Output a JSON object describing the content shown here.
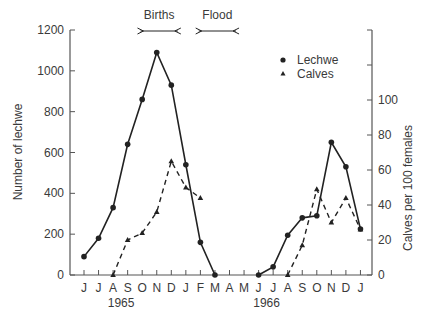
{
  "chart_data": {
    "type": "line",
    "title": "",
    "categories": [
      "J",
      "J",
      "A",
      "S",
      "O",
      "N",
      "D",
      "J",
      "F",
      "M",
      "A",
      "M",
      "J",
      "J",
      "A",
      "S",
      "O",
      "N",
      "D",
      "J"
    ],
    "year_labels": [
      {
        "label": "1965",
        "month_index": 2
      },
      {
        "label": "1966",
        "month_index": 12
      }
    ],
    "xlabel": "",
    "ylabel": "Number of lechwe",
    "ylabel_right": "Calves per 100 females",
    "ylim": [
      0,
      1200
    ],
    "ylim_right": [
      0,
      140
    ],
    "yticks": [
      0,
      200,
      400,
      600,
      800,
      1000,
      1200
    ],
    "yticks_right": [
      0,
      20,
      40,
      60,
      80,
      100
    ],
    "grid": false,
    "legend": {
      "position": "upper-right",
      "entries": [
        {
          "label": "Lechwe",
          "marker": "circle"
        },
        {
          "label": "Calves",
          "marker": "triangle"
        }
      ]
    },
    "annotations": [
      {
        "label": "Births",
        "from_month_index": 4.5,
        "to_month_index": 7.0
      },
      {
        "label": "Flood",
        "from_month_index": 8.5,
        "to_month_index": 11.0
      }
    ],
    "series": [
      {
        "name": "Lechwe",
        "axis": "left",
        "style": "solid",
        "marker": "circle",
        "points": [
          [
            0,
            90
          ],
          [
            1,
            180
          ],
          [
            2,
            330
          ],
          [
            3,
            640
          ],
          [
            4,
            860
          ],
          [
            5,
            1090
          ],
          [
            6,
            930
          ],
          [
            7,
            540
          ],
          [
            8,
            160
          ],
          [
            9,
            0
          ],
          [
            12,
            0
          ],
          [
            13,
            40
          ],
          [
            14,
            195
          ],
          [
            15,
            280
          ],
          [
            16,
            290
          ],
          [
            17,
            650
          ],
          [
            18,
            530
          ],
          [
            19,
            225
          ]
        ]
      },
      {
        "name": "Calves",
        "axis": "right",
        "style": "dashed",
        "marker": "triangle",
        "points": [
          [
            2,
            0
          ],
          [
            3,
            20
          ],
          [
            4,
            24
          ],
          [
            5,
            36
          ],
          [
            6,
            65
          ],
          [
            7,
            50
          ],
          [
            8,
            44
          ],
          [
            14,
            0
          ],
          [
            15,
            17
          ],
          [
            16,
            49
          ],
          [
            17,
            30
          ],
          [
            18,
            44
          ],
          [
            19,
            26
          ]
        ]
      }
    ]
  },
  "labels": {
    "births": "Births",
    "flood": "Flood",
    "legend_lechwe": "Lechwe",
    "legend_calves": "Calves",
    "ylabel_left": "Number of lechwe",
    "ylabel_right": "Calves per 100 females"
  }
}
